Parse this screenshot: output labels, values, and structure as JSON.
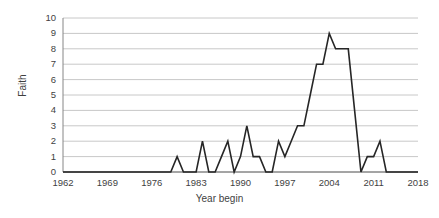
{
  "chart_data": {
    "type": "line",
    "title": "",
    "xlabel": "Year begin",
    "ylabel": "Faith",
    "xlim": [
      1962,
      2018
    ],
    "ylim": [
      0,
      10
    ],
    "grid": true,
    "legend": false,
    "legend_position": "none",
    "line_color": "#262626",
    "axis_color": "#868686",
    "grid_color": "#c8c8c8",
    "y_ticks": [
      10,
      9,
      8,
      7,
      6,
      5,
      4,
      3,
      2,
      1,
      0
    ],
    "x_ticks": [
      1962,
      1969,
      1976,
      1983,
      1990,
      1997,
      2004,
      2011,
      2018
    ],
    "series": [
      {
        "name": "Faith",
        "x": [
          1962,
          1963,
          1964,
          1965,
          1966,
          1967,
          1968,
          1969,
          1970,
          1971,
          1972,
          1973,
          1974,
          1975,
          1976,
          1977,
          1978,
          1979,
          1980,
          1981,
          1982,
          1983,
          1984,
          1985,
          1986,
          1987,
          1988,
          1989,
          1990,
          1991,
          1992,
          1993,
          1994,
          1995,
          1996,
          1997,
          1998,
          1999,
          2000,
          2001,
          2002,
          2003,
          2004,
          2005,
          2006,
          2007,
          2008,
          2009,
          2010,
          2011,
          2012,
          2013,
          2014,
          2015,
          2016,
          2017,
          2018
        ],
        "values": [
          0,
          0,
          0,
          0,
          0,
          0,
          0,
          0,
          0,
          0,
          0,
          0,
          0,
          0,
          0,
          0,
          0,
          0,
          1,
          0,
          0,
          0,
          2,
          0,
          0,
          1,
          2,
          0,
          1,
          3,
          1,
          1,
          0,
          0,
          2,
          1,
          2,
          3,
          3,
          5,
          7,
          7,
          9,
          8,
          8,
          8,
          4,
          0,
          1,
          1,
          2,
          0,
          0,
          0,
          0,
          0,
          0
        ]
      }
    ]
  }
}
